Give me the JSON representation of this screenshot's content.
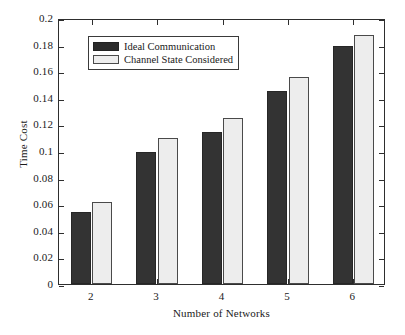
{
  "chart_data": {
    "type": "bar",
    "title": "",
    "xlabel": "Number of Networks",
    "ylabel": "Time Cost",
    "categories": [
      "2",
      "3",
      "4",
      "5",
      "6"
    ],
    "series": [
      {
        "name": "Ideal Communication",
        "color": "#333333",
        "values": [
          0.054,
          0.099,
          0.114,
          0.145,
          0.179
        ]
      },
      {
        "name": "Channel State Considered",
        "color": "#ededed",
        "values": [
          0.062,
          0.11,
          0.125,
          0.156,
          0.187
        ]
      }
    ],
    "ylim": [
      0,
      0.2
    ],
    "ytick_labels": [
      "0",
      "0.02",
      "0.04",
      "0.06",
      "0.08",
      "0.1",
      "0.12",
      "0.14",
      "0.16",
      "0.18",
      "0.2"
    ],
    "ytick_values": [
      0,
      0.02,
      0.04,
      0.06,
      0.08,
      0.1,
      0.12,
      0.14,
      0.16,
      0.18,
      0.2
    ],
    "grid": false,
    "legend_position": "upper left"
  }
}
